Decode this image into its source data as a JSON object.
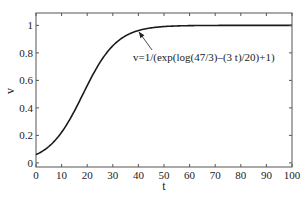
{
  "chart_data": {
    "type": "line",
    "title": "",
    "xlabel": "t",
    "ylabel": "v",
    "xlim": [
      0,
      100
    ],
    "ylim": [
      -0.03,
      1.09
    ],
    "xticks": [
      0,
      10,
      20,
      30,
      40,
      50,
      60,
      70,
      80,
      90,
      100
    ],
    "yticks": [
      0,
      0.2,
      0.4,
      0.6,
      0.8,
      1
    ],
    "ytick_labels": [
      "0",
      "0.2",
      "0.4",
      "0.6",
      "0.8",
      "1"
    ],
    "xtick_labels": [
      "0",
      "10",
      "20",
      "30",
      "40",
      "50",
      "60",
      "70",
      "80",
      "90",
      "100"
    ],
    "grid": false,
    "legend": null,
    "series": [
      {
        "name": "v(t)",
        "formula": "v=1/(exp(log(47/3)-(3 t)/20)+1)",
        "x": [
          0,
          5,
          10,
          15,
          20,
          25,
          30,
          35,
          40,
          45,
          50,
          60,
          70,
          80,
          90,
          100
        ],
        "values": [
          0.06,
          0.12,
          0.223,
          0.382,
          0.569,
          0.737,
          0.859,
          0.931,
          0.968,
          0.985,
          0.993,
          0.9988,
          0.9997,
          0.99996,
          0.99999,
          1.0
        ]
      }
    ],
    "annotations": [
      {
        "text": "v=1/(exp(log(47/3)–(3 t)/20)+1)",
        "arrow_to": [
          39,
          0.975
        ]
      }
    ]
  }
}
